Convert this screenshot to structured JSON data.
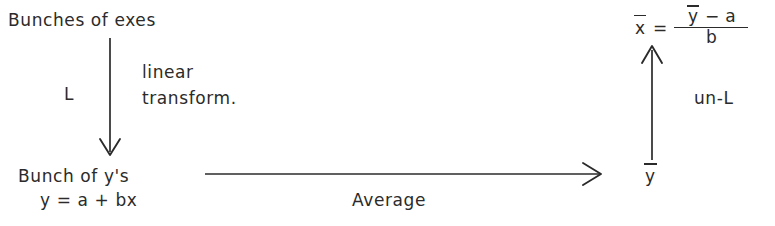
{
  "diagram": {
    "background_color": "#ffffff",
    "ink_color": "#2b2b2b",
    "nodes": {
      "top_left": "Bunches of exes",
      "bottom_left_line1": "Bunch of y's",
      "bottom_left_line2": "y = a + bx",
      "bottom_right": "y",
      "top_right_result": "x"
    },
    "edges": {
      "down_arrow_label": "L",
      "down_arrow_note_line1": "linear",
      "down_arrow_note_line2": "transform.",
      "right_arrow_label": "Average",
      "up_arrow_label": "un-L"
    },
    "formula": {
      "lhs": "x",
      "equals": "=",
      "numerator_left": "y",
      "numerator_op": "−",
      "numerator_right": "a",
      "denominator": "b"
    }
  }
}
